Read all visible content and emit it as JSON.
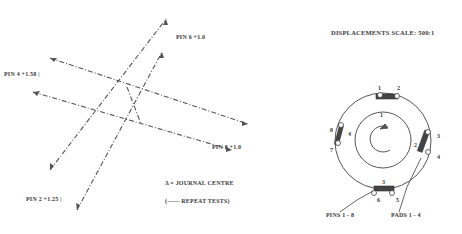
{
  "left_diagram": {
    "labels": {
      "pin6": "PIN 6 +1.0",
      "pin4": "PIN 4 +1.58 |",
      "pin8": "PIN 8 +1.0",
      "pin2": "PIN 2 +1.25 |"
    },
    "legend": {
      "journal_centre": "Δ = JOURNAL CENTRE",
      "repeat_tests": "(—— REPEAT TESTS)"
    }
  },
  "right_diagram": {
    "title": "DISPLACEMENTS SCALE: 500:1",
    "pin_numbers": [
      "1",
      "2",
      "3",
      "4",
      "5",
      "6",
      "7",
      "8"
    ],
    "pad_numbers": [
      "1",
      "2",
      "3",
      "4"
    ],
    "callouts": {
      "pins": "PINS 1 - 8",
      "pads": "PADS 1 - 4"
    }
  }
}
